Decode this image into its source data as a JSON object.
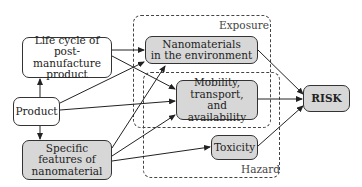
{
  "diagram": {
    "regions": {
      "exposure": {
        "label": "Exposure"
      },
      "hazard": {
        "label": "Hazard"
      }
    },
    "nodes": {
      "life_cycle": {
        "lines": [
          "Life cycle of",
          "post-manufacture",
          "product"
        ]
      },
      "product": {
        "lines": [
          "Product"
        ]
      },
      "specific_features": {
        "lines": [
          "Specific",
          "features of",
          "nanomaterial"
        ]
      },
      "nanomaterials_env": {
        "lines": [
          "Nanomaterials",
          "in the environment"
        ]
      },
      "mobility": {
        "lines": [
          "Mobility,",
          "transport,",
          "and availability"
        ]
      },
      "toxicity": {
        "lines": [
          "Toxicity"
        ]
      },
      "risk": {
        "lines": [
          "RISK"
        ]
      }
    },
    "edges": [
      {
        "from": "product",
        "to": "life_cycle"
      },
      {
        "from": "product",
        "to": "specific_features"
      },
      {
        "from": "product",
        "to": "nanomaterials_env"
      },
      {
        "from": "product",
        "to": "mobility"
      },
      {
        "from": "life_cycle",
        "to": "nanomaterials_env"
      },
      {
        "from": "life_cycle",
        "to": "mobility"
      },
      {
        "from": "specific_features",
        "to": "nanomaterials_env"
      },
      {
        "from": "specific_features",
        "to": "mobility"
      },
      {
        "from": "specific_features",
        "to": "toxicity"
      },
      {
        "from": "nanomaterials_env",
        "to": "risk"
      },
      {
        "from": "mobility",
        "to": "risk"
      },
      {
        "from": "toxicity",
        "to": "risk"
      }
    ],
    "colors": {
      "grey_fill": "#d7d7d7",
      "white_fill": "#ffffff",
      "stroke": "#333333"
    }
  }
}
